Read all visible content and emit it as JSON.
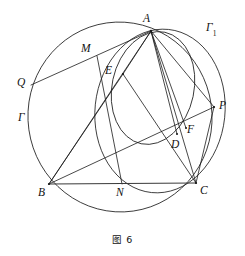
{
  "figure": {
    "caption": "图 6",
    "stroke_color": "#1a1a1a",
    "background_color": "#ffffff",
    "labels": {
      "A": "A",
      "B": "B",
      "C": "C",
      "D": "D",
      "E": "E",
      "F": "F",
      "M": "M",
      "N": "N",
      "P": "P",
      "Q": "Q",
      "Gamma": "Γ",
      "Gamma1_base": "Γ",
      "Gamma1_sub": "1"
    },
    "points": {
      "A": {
        "x": 151,
        "y": 31
      },
      "B": {
        "x": 49,
        "y": 184
      },
      "C": {
        "x": 196,
        "y": 183
      },
      "D": {
        "x": 177,
        "y": 134
      },
      "E": {
        "x": 123,
        "y": 74
      },
      "F": {
        "x": 186,
        "y": 128
      },
      "M": {
        "x": 97,
        "y": 56
      },
      "N": {
        "x": 122,
        "y": 184
      },
      "P": {
        "x": 214,
        "y": 107
      },
      "Q": {
        "x": 31,
        "y": 85
      }
    },
    "label_positions": {
      "A": {
        "x": 143,
        "y": 13
      },
      "B": {
        "x": 38,
        "y": 187
      },
      "C": {
        "x": 200,
        "y": 185
      },
      "D": {
        "x": 171,
        "y": 139
      },
      "E": {
        "x": 105,
        "y": 65
      },
      "F": {
        "x": 187,
        "y": 124
      },
      "M": {
        "x": 81,
        "y": 43
      },
      "N": {
        "x": 116,
        "y": 187
      },
      "P": {
        "x": 219,
        "y": 100
      },
      "Q": {
        "x": 17,
        "y": 77
      },
      "Gamma": {
        "x": 18,
        "y": 112
      },
      "Gamma1": {
        "x": 206,
        "y": 22
      }
    },
    "circles": [
      {
        "name": "Gamma",
        "cx": 120,
        "cy": 117,
        "rx": 92,
        "ry": 95,
        "rotation": -8
      },
      {
        "name": "Gamma1",
        "cx": 160,
        "cy": 111,
        "rx": 65,
        "ry": 82,
        "rotation": 6
      },
      {
        "name": "incircle-AEDF",
        "cx": 153,
        "cy": 88,
        "rx": 41,
        "ry": 57,
        "rotation": 12
      }
    ],
    "segments": [
      {
        "name": "QA",
        "from": "Q",
        "to": "A",
        "emphasis": "normal"
      },
      {
        "name": "AB",
        "from": "A",
        "to": "B",
        "emphasis": "normal"
      },
      {
        "name": "AC",
        "from": "A",
        "to": "C",
        "emphasis": "normal"
      },
      {
        "name": "AD",
        "from": "A",
        "to": "D",
        "emphasis": "normal"
      },
      {
        "name": "AP",
        "from": "A",
        "to": "P",
        "emphasis": "normal"
      },
      {
        "name": "AF",
        "from": "A",
        "to": "F",
        "emphasis": "normal"
      },
      {
        "name": "BC",
        "from": "B",
        "to": "C",
        "emphasis": "bold"
      },
      {
        "name": "BP",
        "from": "B",
        "to": "P",
        "emphasis": "normal"
      },
      {
        "name": "BE",
        "from": "B",
        "to": "E",
        "emphasis": "normal"
      },
      {
        "name": "EA",
        "from": "E",
        "to": "A",
        "emphasis": "normal"
      },
      {
        "name": "MN",
        "from": "M",
        "to": "N",
        "emphasis": "normal"
      },
      {
        "name": "PC",
        "from": "P",
        "to": "C",
        "emphasis": "normal"
      },
      {
        "name": "EC",
        "from": "E",
        "to": "C",
        "emphasis": "normal"
      }
    ]
  }
}
